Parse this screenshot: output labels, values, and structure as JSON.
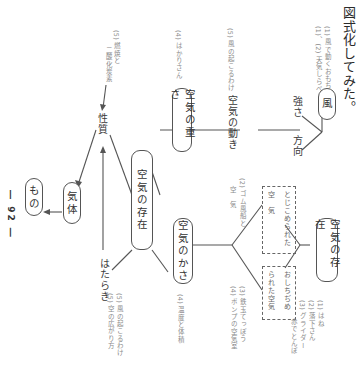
{
  "title": "図式化してみた。",
  "page_number": "― 92 ―",
  "nodes": {
    "kaze": "風",
    "kuuki_no_ugoki": "空気の動き",
    "kuuki_no_omosa": "空気の重さ",
    "kuuki_no_sonzai_center": "空気の存在",
    "kuuki_no_sonzai_right": "空気の存在",
    "kuuki_no_kasa": "空気のかさ",
    "kitai": "気体",
    "mono": "もの"
  },
  "labels": {
    "tsuyosa": "強さ",
    "houkou": "方向",
    "seishitsu": "性質",
    "hataraki": "はたらき"
  },
  "dashed_boxes": {
    "tojikomerareta": [
      "とじこめられた",
      "空　気"
    ],
    "oshichijimerareta": [
      "おしちぢめ",
      "られた空気"
    ]
  },
  "notes": {
    "kaze_notes": [
      "(1) 風で動くおもちゃ",
      "(1)、(2) 天気しらべ"
    ],
    "ugoki_note": "(5) 風の起こるわけ",
    "omosa_note": "(4) はかりさん",
    "seishitsu_note": [
      "(5) 燃焼と",
      "二酸化炭素"
    ],
    "tojikome_note": [
      "(2) ゴム風船と",
      "空　気"
    ],
    "oshichijime_note": [
      "(3) 鉄玉てっぽう",
      "(4) ポンプの空気室"
    ],
    "sonzai_right_note": [
      "(1) はね",
      "(2) 落下さん",
      "(3) グライダー",
      "赤でとんぼ"
    ],
    "kasa_note": "(4) 温度と体積",
    "bottom_notes": [
      "(5) 風の起こるわけ",
      "(5) 空の広がり方"
    ]
  },
  "colors": {
    "line": "#555555",
    "note_text": "#8a8a8a",
    "background": "#ffffff"
  }
}
